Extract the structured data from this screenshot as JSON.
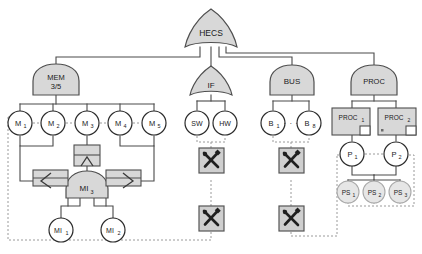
{
  "diagram": {
    "type": "fault-tree",
    "title_node": "HECS",
    "colors": {
      "gate_fill": "#d8d8d8",
      "gate_stroke": "#4f4f4f",
      "event_fill": "#ffffff",
      "event_stroke": "#2b2b2b",
      "faded_fill": "#e8e8e8",
      "faded_stroke": "#a9a9a9",
      "line": "#4a4a4a",
      "dotted": "#8a8a8a",
      "tool_fill": "#cfcfcf",
      "tool_stroke": "#3a3a3a"
    },
    "top_gate": {
      "label": "HECS",
      "gate_type": "or"
    },
    "gates": [
      {
        "id": "mem",
        "label": "MEM",
        "sublabel": "3/5",
        "gate_type": "voting"
      },
      {
        "id": "if",
        "label": "IF",
        "sublabel": "",
        "gate_type": "or"
      },
      {
        "id": "bus",
        "label": "BUS",
        "sublabel": "",
        "gate_type": "and"
      },
      {
        "id": "proc",
        "label": "PROC",
        "sublabel": "",
        "gate_type": "and"
      },
      {
        "id": "mi3",
        "label": "MI",
        "sublabel": "3",
        "gate_type": "and"
      }
    ],
    "memory_events": [
      {
        "label": "M",
        "sub": "1"
      },
      {
        "label": "M",
        "sub": "2"
      },
      {
        "label": "M",
        "sub": "3"
      },
      {
        "label": "M",
        "sub": "4"
      },
      {
        "label": "M",
        "sub": "5"
      }
    ],
    "interface_events": [
      {
        "label": "SW",
        "sub": ""
      },
      {
        "label": "HW",
        "sub": ""
      }
    ],
    "bus_events": [
      {
        "label": "B",
        "sub": "1"
      },
      {
        "label": "B",
        "sub": "8"
      }
    ],
    "bus_ellipsis": "· · ·",
    "mi_events": [
      {
        "label": "MI",
        "sub": "1"
      },
      {
        "label": "MI",
        "sub": "2"
      }
    ],
    "proc_modules": [
      {
        "label": "PROC",
        "sub": "1"
      },
      {
        "label": "PROC",
        "sub": "2"
      }
    ],
    "processor_events": [
      {
        "label": "P",
        "sub": "1"
      },
      {
        "label": "P",
        "sub": "2"
      }
    ],
    "power_supply_events": [
      {
        "label": "PS",
        "sub": "1"
      },
      {
        "label": "PS",
        "sub": "2"
      },
      {
        "label": "PS",
        "sub": "3"
      }
    ],
    "transfer_symbols": [
      {
        "id": "transfer-in-left",
        "direction": "left"
      },
      {
        "id": "transfer-up",
        "direction": "up"
      },
      {
        "id": "transfer-out-right",
        "direction": "right"
      }
    ],
    "tool_icons": [
      {
        "id": "tool-icon-if-upper"
      },
      {
        "id": "tool-icon-bus-upper"
      },
      {
        "id": "tool-icon-if-lower"
      },
      {
        "id": "tool-icon-bus-lower"
      }
    ]
  }
}
